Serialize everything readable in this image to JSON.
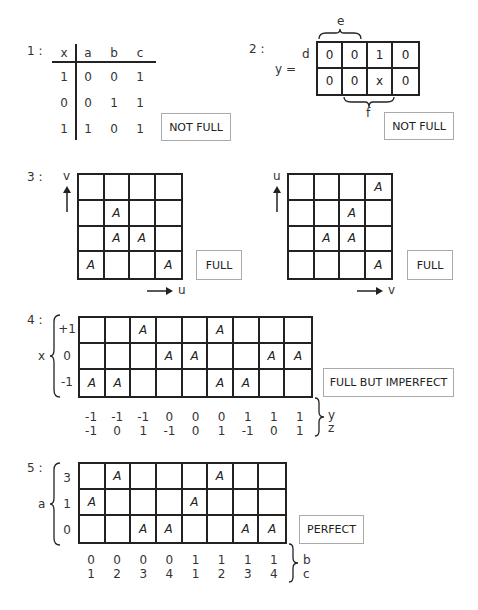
{
  "section1": {
    "label": "1 :",
    "headers": [
      "x",
      "a",
      "b",
      "c"
    ],
    "rows": [
      [
        "1",
        "0",
        "0",
        "1"
      ],
      [
        "0",
        "0",
        "1",
        "1"
      ],
      [
        "1",
        "1",
        "0",
        "1"
      ]
    ],
    "verdict": "NOT FULL"
  },
  "section2": {
    "label": "2 :",
    "y_label": "y =",
    "row_var": "d",
    "top_brace": "e",
    "bottom_brace": "f",
    "cells": [
      [
        "0",
        "0",
        "1",
        "0"
      ],
      [
        "0",
        "0",
        "x",
        "0"
      ]
    ],
    "verdict": "NOT FULL"
  },
  "section3": {
    "label": "3 :",
    "left": {
      "y_axis": "v",
      "x_axis": "u",
      "cells": [
        [
          "",
          "",
          "",
          ""
        ],
        [
          "",
          "A",
          "",
          ""
        ],
        [
          "",
          "A",
          "A",
          ""
        ],
        [
          "A",
          "",
          "",
          "A"
        ]
      ],
      "verdict": "FULL"
    },
    "right": {
      "y_axis": "u",
      "x_axis": "v",
      "cells": [
        [
          "",
          "",
          "",
          "A"
        ],
        [
          "",
          "",
          "A",
          ""
        ],
        [
          "",
          "A",
          "A",
          ""
        ],
        [
          "",
          "",
          "",
          "A"
        ]
      ],
      "verdict": "FULL"
    }
  },
  "section4": {
    "label": "4 :",
    "row_var": "x",
    "row_labels": [
      "+1",
      "0",
      "-1"
    ],
    "cells": [
      [
        "",
        "",
        "A",
        "",
        "",
        "A",
        "",
        "",
        ""
      ],
      [
        "",
        "",
        "",
        "A",
        "A",
        "",
        "",
        "A",
        "A"
      ],
      [
        "A",
        "A",
        "",
        "",
        "",
        "A",
        "A",
        "",
        ""
      ]
    ],
    "col_labels_1": [
      "-1",
      "-1",
      "-1",
      "0",
      "0",
      "0",
      "1",
      "1",
      "1"
    ],
    "col_labels_2": [
      "-1",
      "0",
      "1",
      "-1",
      "0",
      "1",
      "-1",
      "0",
      "1"
    ],
    "col_vars": [
      "y",
      "z"
    ],
    "verdict": "FULL BUT IMPERFECT"
  },
  "section5": {
    "label": "5 :",
    "row_var": "a",
    "row_labels": [
      "3",
      "1",
      "0"
    ],
    "cells": [
      [
        "",
        "A",
        "",
        "",
        "",
        "A",
        "",
        ""
      ],
      [
        "A",
        "",
        "",
        "",
        "A",
        "",
        "",
        ""
      ],
      [
        "",
        "",
        "A",
        "A",
        "",
        "",
        "A",
        "A"
      ]
    ],
    "col_labels_1": [
      "0",
      "0",
      "0",
      "0",
      "1",
      "1",
      "1",
      "1"
    ],
    "col_labels_2": [
      "1",
      "2",
      "3",
      "4",
      "1",
      "2",
      "3",
      "4"
    ],
    "col_vars": [
      "b",
      "c"
    ],
    "verdict": "PERFECT"
  }
}
